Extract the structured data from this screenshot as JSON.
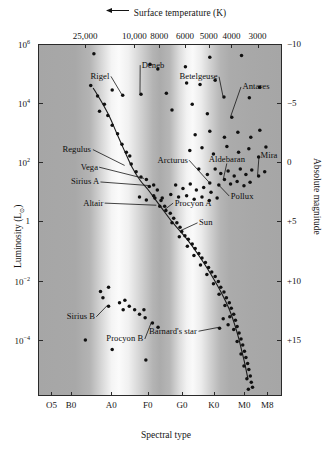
{
  "figure": {
    "top_axis_title": "Surface temperature (K)",
    "top_axis_arrow": "←",
    "bottom_axis_title": "Spectral type",
    "left_axis_title_pre": "Luminosity (L",
    "left_axis_title_sub": "⊙",
    "left_axis_title_post": ")",
    "right_axis_title": "Absolute magnitude"
  },
  "chart_data": {
    "type": "scatter",
    "xlabel": "Spectral type",
    "ylabel": "Luminosity (L⊙)",
    "x2label": "Surface temperature (K)",
    "y2label": "Absolute magnitude",
    "grid": false,
    "legend_position": "none",
    "top_axis": {
      "label": "Surface temperature (K)",
      "direction": "decreasing-right",
      "tick_labels": [
        "25,000",
        "10,000",
        "8000",
        "6000",
        "5000",
        "4000",
        "3000"
      ],
      "tick_x_frac": [
        0.193,
        0.395,
        0.497,
        0.602,
        0.7,
        0.793,
        0.9
      ]
    },
    "bottom_axis": {
      "label": "Spectral type",
      "tick_labels": [
        "O5",
        "B0",
        "A0",
        "F0",
        "G0",
        "K0",
        "M0",
        "M8"
      ],
      "tick_x_frac": [
        0.055,
        0.135,
        0.3,
        0.45,
        0.59,
        0.72,
        0.845,
        0.94
      ]
    },
    "left_axis": {
      "label": "Luminosity (L⊙)",
      "scale": "log10",
      "tick_labels": [
        "10⁶",
        "10⁴",
        "10²",
        "1",
        "10⁻²",
        "10⁻⁴"
      ],
      "tick_values": [
        1000000,
        10000,
        100,
        1,
        0.01,
        0.0001
      ],
      "tick_y_frac": [
        0.0,
        0.168,
        0.336,
        0.504,
        0.672,
        0.84
      ]
    },
    "right_axis": {
      "label": "Absolute magnitude",
      "tick_labels": [
        "-10",
        "-5",
        "0",
        "+5",
        "+10",
        "+15"
      ],
      "tick_values": [
        -10,
        -5,
        0,
        5,
        10,
        15
      ],
      "tick_y_frac": [
        0.0,
        0.168,
        0.336,
        0.504,
        0.672,
        0.84
      ]
    },
    "annotations": [
      {
        "name": "Rigel",
        "label_x_frac": 0.215,
        "label_y_frac": 0.092,
        "point_x_frac": 0.343,
        "point_y_frac": 0.143
      },
      {
        "name": "Deneb",
        "label_x_frac": 0.425,
        "label_y_frac": 0.06,
        "point_x_frac": 0.418,
        "point_y_frac": 0.14
      },
      {
        "name": "Betelgeuse",
        "label_x_frac": 0.58,
        "label_y_frac": 0.093,
        "point_x_frac": 0.758,
        "point_y_frac": 0.148
      },
      {
        "name": "Antares",
        "label_x_frac": 0.838,
        "label_y_frac": 0.122,
        "point_x_frac": 0.79,
        "point_y_frac": 0.205
      },
      {
        "name": "Regulus",
        "label_x_frac": 0.1,
        "label_y_frac": 0.3,
        "point_x_frac": 0.355,
        "point_y_frac": 0.345
      },
      {
        "name": "Vega",
        "label_x_frac": 0.175,
        "label_y_frac": 0.35,
        "point_x_frac": 0.435,
        "point_y_frac": 0.382
      },
      {
        "name": "Sirius A",
        "label_x_frac": 0.135,
        "label_y_frac": 0.392,
        "point_x_frac": 0.452,
        "point_y_frac": 0.402
      },
      {
        "name": "Altair",
        "label_x_frac": 0.185,
        "label_y_frac": 0.452,
        "point_x_frac": 0.485,
        "point_y_frac": 0.458
      },
      {
        "name": "Arcturus",
        "label_x_frac": 0.49,
        "label_y_frac": 0.33,
        "point_x_frac": 0.7,
        "point_y_frac": 0.392
      },
      {
        "name": "Aldebaran",
        "label_x_frac": 0.7,
        "label_y_frac": 0.328,
        "point_x_frac": 0.76,
        "point_y_frac": 0.382
      },
      {
        "name": "Mira",
        "label_x_frac": 0.912,
        "label_y_frac": 0.318,
        "point_x_frac": 0.9,
        "point_y_frac": 0.372
      },
      {
        "name": "Pollux",
        "label_x_frac": 0.79,
        "label_y_frac": 0.432,
        "point_x_frac": 0.737,
        "point_y_frac": 0.398
      },
      {
        "name": "Procyon A",
        "label_x_frac": 0.56,
        "label_y_frac": 0.452,
        "point_x_frac": 0.52,
        "point_y_frac": 0.47
      },
      {
        "name": "Sun",
        "label_x_frac": 0.66,
        "label_y_frac": 0.508,
        "point_x_frac": 0.585,
        "point_y_frac": 0.53
      },
      {
        "name": "Sirius B",
        "label_x_frac": 0.118,
        "label_y_frac": 0.775,
        "point_x_frac": 0.285,
        "point_y_frac": 0.742
      },
      {
        "name": "Procyon B",
        "label_x_frac": 0.28,
        "label_y_frac": 0.838,
        "point_x_frac": 0.465,
        "point_y_frac": 0.79
      },
      {
        "name": "Barnard's star",
        "label_x_frac": 0.455,
        "label_y_frac": 0.816,
        "point_x_frac": 0.74,
        "point_y_frac": 0.805
      }
    ],
    "main_sequence_curve": [
      [
        0.222,
        0.122
      ],
      [
        0.255,
        0.16
      ],
      [
        0.29,
        0.205
      ],
      [
        0.318,
        0.25
      ],
      [
        0.35,
        0.3
      ],
      [
        0.382,
        0.348
      ],
      [
        0.415,
        0.385
      ],
      [
        0.448,
        0.412
      ],
      [
        0.478,
        0.44
      ],
      [
        0.51,
        0.47
      ],
      [
        0.545,
        0.502
      ],
      [
        0.58,
        0.53
      ],
      [
        0.618,
        0.562
      ],
      [
        0.655,
        0.598
      ],
      [
        0.69,
        0.635
      ],
      [
        0.722,
        0.672
      ],
      [
        0.752,
        0.71
      ],
      [
        0.778,
        0.748
      ],
      [
        0.8,
        0.79
      ],
      [
        0.818,
        0.832
      ],
      [
        0.832,
        0.872
      ],
      [
        0.845,
        0.91
      ],
      [
        0.856,
        0.948
      ]
    ],
    "points": {
      "supergiants": [
        [
          0.225,
          0.025
        ],
        [
          0.455,
          0.055
        ],
        [
          0.487,
          0.068
        ],
        [
          0.6,
          0.062
        ],
        [
          0.7,
          0.035
        ],
        [
          0.83,
          0.03
        ],
        [
          0.3,
          0.128
        ],
        [
          0.343,
          0.143
        ],
        [
          0.418,
          0.14
        ],
        [
          0.522,
          0.137
        ],
        [
          0.605,
          0.108
        ],
        [
          0.66,
          0.112
        ],
        [
          0.722,
          0.1
        ],
        [
          0.758,
          0.148
        ],
        [
          0.79,
          0.205
        ],
        [
          0.628,
          0.168
        ],
        [
          0.545,
          0.185
        ],
        [
          0.69,
          0.195
        ],
        [
          0.862,
          0.15
        ],
        [
          0.905,
          0.12
        ]
      ],
      "giants": [
        [
          0.64,
          0.255
        ],
        [
          0.7,
          0.245
        ],
        [
          0.76,
          0.262
        ],
        [
          0.815,
          0.248
        ],
        [
          0.868,
          0.262
        ],
        [
          0.905,
          0.242
        ],
        [
          0.618,
          0.3
        ],
        [
          0.668,
          0.292
        ],
        [
          0.715,
          0.31
        ],
        [
          0.77,
          0.288
        ],
        [
          0.818,
          0.305
        ],
        [
          0.86,
          0.295
        ],
        [
          0.9,
          0.318
        ],
        [
          0.93,
          0.29
        ],
        [
          0.655,
          0.352
        ],
        [
          0.69,
          0.368
        ],
        [
          0.722,
          0.352
        ],
        [
          0.745,
          0.365
        ],
        [
          0.775,
          0.358
        ],
        [
          0.8,
          0.372
        ],
        [
          0.825,
          0.352
        ],
        [
          0.848,
          0.368
        ],
        [
          0.872,
          0.355
        ],
        [
          0.9,
          0.372
        ],
        [
          0.925,
          0.36
        ],
        [
          0.7,
          0.392
        ],
        [
          0.737,
          0.398
        ],
        [
          0.76,
          0.382
        ],
        [
          0.785,
          0.395
        ],
        [
          0.812,
          0.388
        ],
        [
          0.84,
          0.4
        ],
        [
          0.865,
          0.39
        ],
        [
          0.56,
          0.398
        ],
        [
          0.59,
          0.408
        ],
        [
          0.62,
          0.395
        ],
        [
          0.645,
          0.412
        ],
        [
          0.675,
          0.405
        ],
        [
          0.705,
          0.418
        ],
        [
          0.54,
          0.425
        ],
        [
          0.572,
          0.432
        ],
        [
          0.605,
          0.428
        ],
        [
          0.636,
          0.438
        ],
        [
          0.668,
          0.432
        ],
        [
          0.698,
          0.442
        ],
        [
          0.73,
          0.435
        ],
        [
          0.505,
          0.435
        ],
        [
          0.47,
          0.428
        ],
        [
          0.44,
          0.44
        ],
        [
          0.412,
          0.432
        ]
      ],
      "main_sequence_scatter": [
        [
          0.212,
          0.115
        ],
        [
          0.24,
          0.145
        ],
        [
          0.268,
          0.168
        ],
        [
          0.248,
          0.188
        ],
        [
          0.282,
          0.2
        ],
        [
          0.3,
          0.228
        ],
        [
          0.322,
          0.252
        ],
        [
          0.34,
          0.282
        ],
        [
          0.358,
          0.305
        ],
        [
          0.378,
          0.338
        ],
        [
          0.398,
          0.36
        ],
        [
          0.372,
          0.315
        ],
        [
          0.418,
          0.375
        ],
        [
          0.44,
          0.382
        ],
        [
          0.452,
          0.402
        ],
        [
          0.47,
          0.398
        ],
        [
          0.485,
          0.412
        ],
        [
          0.475,
          0.435
        ],
        [
          0.5,
          0.442
        ],
        [
          0.515,
          0.458
        ],
        [
          0.52,
          0.47
        ],
        [
          0.495,
          0.458
        ],
        [
          0.538,
          0.478
        ],
        [
          0.552,
          0.492
        ],
        [
          0.565,
          0.505
        ],
        [
          0.545,
          0.505
        ],
        [
          0.578,
          0.518
        ],
        [
          0.585,
          0.53
        ],
        [
          0.598,
          0.542
        ],
        [
          0.575,
          0.545
        ],
        [
          0.612,
          0.552
        ],
        [
          0.628,
          0.565
        ],
        [
          0.608,
          0.572
        ],
        [
          0.64,
          0.578
        ],
        [
          0.655,
          0.592
        ],
        [
          0.635,
          0.598
        ],
        [
          0.668,
          0.605
        ],
        [
          0.682,
          0.618
        ],
        [
          0.662,
          0.625
        ],
        [
          0.695,
          0.632
        ],
        [
          0.708,
          0.645
        ],
        [
          0.688,
          0.652
        ],
        [
          0.722,
          0.658
        ],
        [
          0.735,
          0.672
        ],
        [
          0.715,
          0.678
        ],
        [
          0.745,
          0.688
        ],
        [
          0.758,
          0.702
        ],
        [
          0.738,
          0.708
        ],
        [
          0.768,
          0.718
        ],
        [
          0.78,
          0.732
        ],
        [
          0.762,
          0.74
        ],
        [
          0.788,
          0.748
        ],
        [
          0.798,
          0.765
        ],
        [
          0.782,
          0.772
        ],
        [
          0.805,
          0.782
        ],
        [
          0.812,
          0.8
        ],
        [
          0.798,
          0.808
        ],
        [
          0.82,
          0.818
        ],
        [
          0.828,
          0.835
        ],
        [
          0.812,
          0.842
        ],
        [
          0.835,
          0.852
        ],
        [
          0.842,
          0.87
        ],
        [
          0.828,
          0.878
        ],
        [
          0.848,
          0.888
        ],
        [
          0.855,
          0.905
        ],
        [
          0.84,
          0.912
        ],
        [
          0.86,
          0.922
        ],
        [
          0.866,
          0.94
        ],
        [
          0.852,
          0.948
        ],
        [
          0.87,
          0.958
        ],
        [
          0.875,
          0.972
        ],
        [
          0.858,
          0.978
        ],
        [
          0.74,
          0.805
        ],
        [
          0.755,
          0.778
        ],
        [
          0.775,
          0.795
        ]
      ],
      "white_dwarfs": [
        [
          0.252,
          0.7
        ],
        [
          0.285,
          0.688
        ],
        [
          0.262,
          0.718
        ],
        [
          0.285,
          0.742
        ],
        [
          0.33,
          0.732
        ],
        [
          0.352,
          0.725
        ],
        [
          0.37,
          0.742
        ],
        [
          0.392,
          0.752
        ],
        [
          0.412,
          0.765
        ],
        [
          0.435,
          0.775
        ],
        [
          0.465,
          0.79
        ],
        [
          0.488,
          0.802
        ],
        [
          0.43,
          0.752
        ],
        [
          0.345,
          0.752
        ]
      ],
      "lower_scatter": [
        [
          0.19,
          0.838
        ],
        [
          0.3,
          0.865
        ],
        [
          0.438,
          0.895
        ]
      ]
    }
  }
}
